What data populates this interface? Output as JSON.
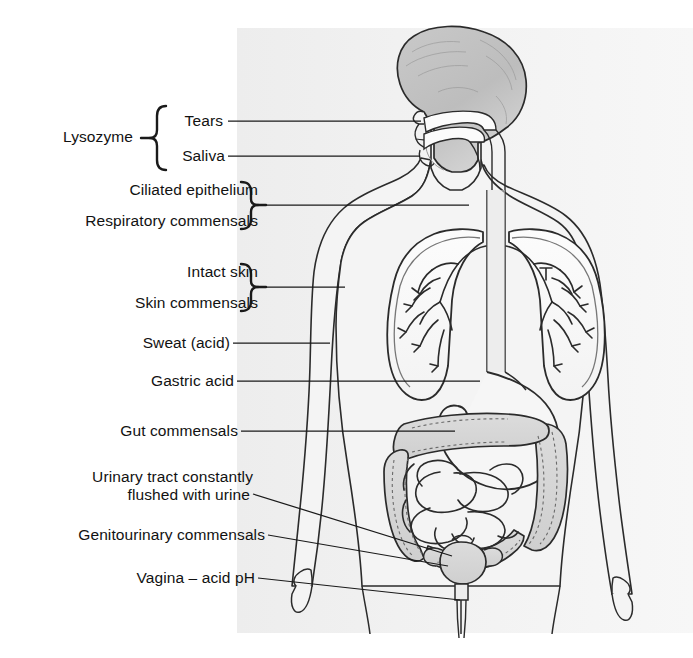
{
  "figure": {
    "background_color": "#ffffff",
    "plate_color": "#f0f0f0",
    "ink_color": "#1a1a1a",
    "width": 693,
    "height": 658
  },
  "labels": {
    "lysozyme": "Lysozyme",
    "tears": "Tears",
    "saliva": "Saliva",
    "ciliated_epithelium": "Ciliated epithelium",
    "respiratory_commensals": "Respiratory commensals",
    "intact_skin": "Intact skin",
    "skin_commensals": "Skin commensals",
    "sweat_acid": "Sweat (acid)",
    "gastric_acid": "Gastric acid",
    "gut_commensals": "Gut commensals",
    "urinary_tract_line1": "Urinary tract constantly",
    "urinary_tract_line2": "flushed with urine",
    "genitourinary_commensals": "Genitourinary commensals",
    "vagina_acid_ph": "Vagina – acid pH"
  },
  "groups": {
    "lysozyme_brace_members": [
      "Tears",
      "Saliva"
    ],
    "respiratory_brace_members": [
      "Ciliated epithelium",
      "Respiratory commensals"
    ],
    "skin_brace_members": [
      "Intact skin",
      "Skin commensals"
    ]
  },
  "anatomy": {
    "head": "head-profile",
    "nasal_cavity": "nasal-cavity",
    "oral_cavity": "oral-cavity",
    "trachea": "trachea",
    "esophagus": "esophagus",
    "left_lung": "left-lung",
    "right_lung": "right-lung",
    "bronchial_tree": "bronchial-tree",
    "stomach": "stomach",
    "large_intestine": "large-intestine",
    "small_intestine": "small-intestine",
    "bladder": "urinary-bladder",
    "urethra": "urethra",
    "torso": "body-outline",
    "left_arm": "left-arm",
    "right_arm": "right-arm"
  }
}
